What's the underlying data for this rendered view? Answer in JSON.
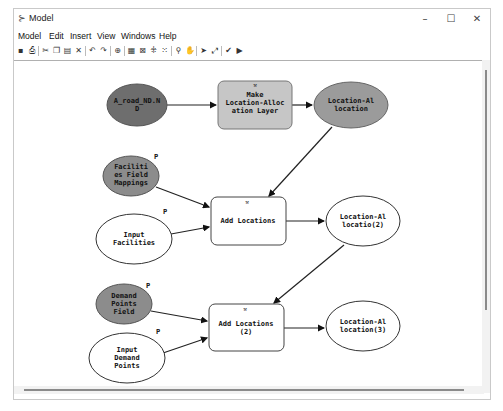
{
  "window": {
    "title": "Model",
    "icon": "model-builder-icon",
    "controls": {
      "minimize": "–",
      "maximize": "☐",
      "close": "✕"
    }
  },
  "menu": [
    {
      "label": "Model"
    },
    {
      "label": "Edit"
    },
    {
      "label": "Insert"
    },
    {
      "label": "View"
    },
    {
      "label": "Windows"
    },
    {
      "label": "Help"
    }
  ],
  "toolbar": [
    {
      "icon": "save-icon",
      "glyph": "▪"
    },
    {
      "icon": "print-icon",
      "glyph": "⎙"
    },
    {
      "sep": true
    },
    {
      "icon": "cut-icon",
      "glyph": "✂"
    },
    {
      "icon": "copy-icon",
      "glyph": "❐"
    },
    {
      "icon": "paste-icon",
      "glyph": "▤"
    },
    {
      "icon": "delete-icon",
      "glyph": "✕"
    },
    {
      "sep": true
    },
    {
      "icon": "undo-icon",
      "glyph": "↶"
    },
    {
      "icon": "redo-icon",
      "glyph": "↷"
    },
    {
      "sep": true
    },
    {
      "icon": "add-data-icon",
      "glyph": "⊕"
    },
    {
      "sep": true
    },
    {
      "icon": "auto-layout-icon",
      "glyph": "▦"
    },
    {
      "icon": "full-extent-icon",
      "glyph": "⊠"
    },
    {
      "icon": "fixed-zoom-in-icon",
      "glyph": "⁜"
    },
    {
      "icon": "fixed-zoom-out-icon",
      "glyph": "⁙"
    },
    {
      "sep": true
    },
    {
      "icon": "zoom-icon",
      "glyph": "⚲"
    },
    {
      "icon": "pan-icon",
      "glyph": "✋"
    },
    {
      "sep": true
    },
    {
      "icon": "select-icon",
      "glyph": "➤"
    },
    {
      "icon": "connect-icon",
      "glyph": "⤢"
    },
    {
      "sep": true
    },
    {
      "icon": "validate-icon",
      "glyph": "✔"
    },
    {
      "icon": "run-icon",
      "glyph": "▶"
    }
  ],
  "diagram": {
    "param_marker": "P",
    "nodes": [
      {
        "id": "road_nd",
        "lines": [
          "A_road_ND.N",
          "D"
        ],
        "type": "input-data",
        "fill": "#6e6e6e"
      },
      {
        "id": "make_la",
        "lines": [
          "Make",
          "Location-Alloc",
          "ation Layer"
        ],
        "type": "tool",
        "fill": "#c6c6c6"
      },
      {
        "id": "la_out",
        "lines": [
          "Location-Al",
          "location"
        ],
        "type": "derived-data",
        "fill": "#9b9b9b"
      },
      {
        "id": "fac_map",
        "lines": [
          "Faciliti",
          "es Field",
          "Mappings"
        ],
        "type": "variable",
        "fill": "#8c8c8c"
      },
      {
        "id": "in_fac",
        "lines": [
          "Input",
          "Facilities"
        ],
        "type": "variable",
        "fill": "#ffffff"
      },
      {
        "id": "add_loc1",
        "lines": [
          "Add Locations"
        ],
        "type": "tool",
        "fill": "#ffffff"
      },
      {
        "id": "la_out2",
        "lines": [
          "Location-Al",
          "locatio(2)"
        ],
        "type": "derived-data",
        "fill": "#ffffff"
      },
      {
        "id": "dem_field",
        "lines": [
          "Demand",
          "Points",
          "Field"
        ],
        "type": "variable",
        "fill": "#8c8c8c"
      },
      {
        "id": "in_dem",
        "lines": [
          "Input",
          "Demand",
          "Points"
        ],
        "type": "variable",
        "fill": "#ffffff"
      },
      {
        "id": "add_loc2",
        "lines": [
          "Add Locations",
          "(2)"
        ],
        "type": "tool",
        "fill": "#ffffff"
      },
      {
        "id": "la_out3",
        "lines": [
          "Location-Al",
          "location(3)"
        ],
        "type": "derived-data",
        "fill": "#ffffff"
      }
    ]
  }
}
